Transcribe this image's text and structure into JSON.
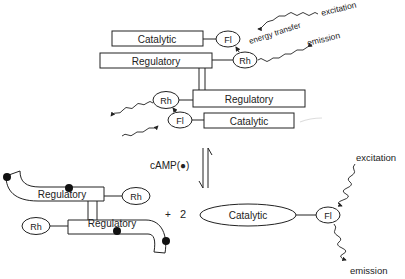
{
  "diagram": {
    "top_complex": {
      "catalytic_label": "Catalytic",
      "regulatory_label": "Regulatory",
      "fl_label": "Fl",
      "rh_label": "Rh",
      "excitation_label": "excitation",
      "energy_transfer_label": "energy transfer",
      "emission_label": "emission"
    },
    "lower_complex": {
      "regulatory_label": "Regulatory",
      "catalytic_label": "Catalytic",
      "rh_label": "Rh",
      "fl_label": "Fl"
    },
    "equilibrium": {
      "ligand_label": "cAMP(●)"
    },
    "products": {
      "regulatory_dimer": {
        "regulatory_top_label": "Regulatory",
        "regulatory_bottom_label": "Regulatory",
        "rh_right_label": "Rh",
        "rh_left_label": "Rh"
      },
      "plus_label": "+",
      "stoich_label": "2",
      "free_catalytic": {
        "catalytic_label": "Catalytic",
        "fl_label": "Fl",
        "excitation_label": "excitation",
        "emission_label": "emission"
      }
    }
  }
}
